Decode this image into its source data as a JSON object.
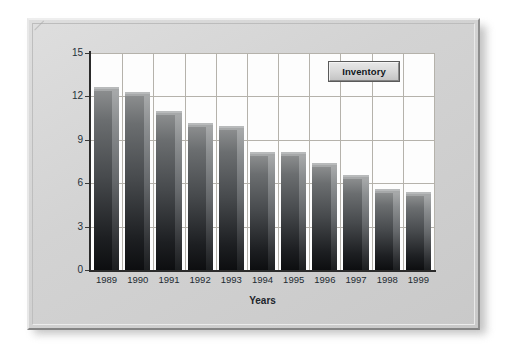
{
  "figure": {
    "frame_style": "beveled-gray-plaque",
    "background_color": "#d6d6d6",
    "plot_background": "#fdfdfd",
    "gridline_color": "#b5b2ab",
    "bar_color_top": "#8b8d8e",
    "bar_color_bottom": "#0d0e10"
  },
  "legend": {
    "label": "Inventory"
  },
  "chart_data": {
    "type": "bar",
    "title": "",
    "xlabel": "Years",
    "ylabel": "Percentage of Total Assets",
    "categories": [
      "1989",
      "1990",
      "1991",
      "1992",
      "1993",
      "1994",
      "1995",
      "1996",
      "1997",
      "1998",
      "1999"
    ],
    "values": [
      12.4,
      12.0,
      10.7,
      9.9,
      9.7,
      7.9,
      7.9,
      7.1,
      6.3,
      5.3,
      5.1
    ],
    "series": [
      {
        "name": "Inventory",
        "values": [
          12.4,
          12.0,
          10.7,
          9.9,
          9.7,
          7.9,
          7.9,
          7.1,
          6.3,
          5.3,
          5.1
        ]
      }
    ],
    "ylim": [
      0,
      15
    ],
    "yticks": [
      0,
      3,
      6,
      9,
      12,
      15
    ],
    "ytick_labels": [
      "0",
      "3",
      "6",
      "9",
      "12",
      "15"
    ],
    "grid": "horizontal-and-vertical",
    "legend_position": "upper-right-inside"
  }
}
